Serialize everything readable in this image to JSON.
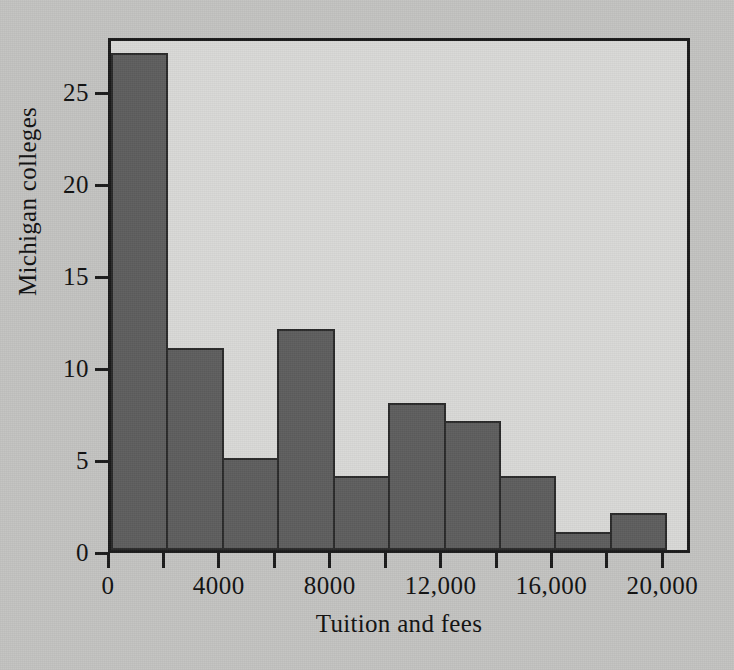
{
  "chart_data": {
    "type": "bar",
    "title": "",
    "subtitle": "",
    "xlabel": "Tuition and fees",
    "ylabel": "Michigan colleges",
    "bin_width": 2000,
    "bin_edges": [
      0,
      2000,
      4000,
      6000,
      8000,
      10000,
      12000,
      14000,
      16000,
      18000,
      20000
    ],
    "categories": [
      "0-2000",
      "2000-4000",
      "4000-6000",
      "6000-8000",
      "8000-10,000",
      "10,000-12,000",
      "12,000-14,000",
      "14,000-16,000",
      "16,000-18,000",
      "18,000-20,000"
    ],
    "values": [
      27,
      11,
      5,
      12,
      4,
      8,
      7,
      4,
      1,
      2
    ],
    "xlim": [
      0,
      21000
    ],
    "ylim": [
      0,
      28
    ],
    "x_major_ticks": [
      0,
      4000,
      8000,
      12000,
      16000,
      20000
    ],
    "x_major_tick_labels": [
      "0",
      "4000",
      "8000",
      "12,000",
      "16,000",
      "20,000"
    ],
    "x_minor_ticks": [
      2000,
      6000,
      10000,
      14000,
      18000
    ],
    "y_ticks": [
      0,
      5,
      10,
      15,
      20,
      25
    ],
    "y_tick_labels": [
      "0",
      "5",
      "10",
      "15",
      "20",
      "25"
    ],
    "grid": false,
    "legend": null,
    "colors": {
      "bar_fill": "#5e5e5e",
      "bar_edge": "#2a2a2a",
      "plot_background": "#d9d9d7",
      "page_background": "#c3c3c1",
      "axis": "#1a1a1a",
      "text": "#111111"
    }
  }
}
